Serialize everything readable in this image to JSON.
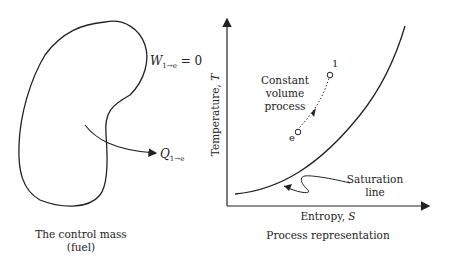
{
  "left_panel": {
    "work_label": "W",
    "work_sub": "1→e",
    "work_eq": " = 0",
    "heat_label": "Q",
    "heat_sub": "1→e",
    "caption_line1": "The control mass",
    "caption_line2": "(fuel)"
  },
  "right_panel": {
    "y_axis_label": "Temperature, ",
    "y_axis_var": "T",
    "x_axis_label": "Entropy, ",
    "x_axis_var": "S",
    "process_label_line1": "Constant",
    "process_label_line2": "volume",
    "process_label_line3": "process",
    "state_start": "1",
    "state_end": "e",
    "saturation_line1": "Saturation",
    "saturation_line2": "line",
    "caption": "Process representation"
  }
}
